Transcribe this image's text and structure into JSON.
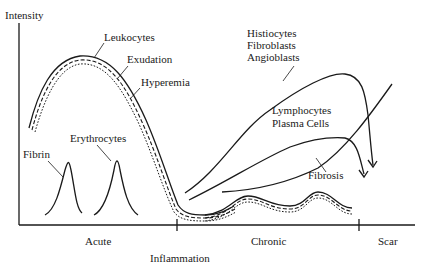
{
  "diagram": {
    "axes": {
      "y_label": "Intensity",
      "x_phase_labels": [
        "Acute",
        "Chronic",
        "Scar"
      ],
      "x_center_label": "Inflammation"
    },
    "curves": {
      "leukocytes": "Leukocytes",
      "exudation": "Exudation",
      "hyperemia": "Hyperemia",
      "fibrin": "Fibrin",
      "erythrocytes": "Erythrocytes",
      "histiocytes_group": [
        "Histiocytes",
        "Fibroblasts",
        "Angioblasts"
      ],
      "lymphocytes_group": [
        "Lymphocytes",
        "Plasma Cells"
      ],
      "fibrosis": "Fibrosis"
    },
    "colors": {
      "ink": "#1a1a1a",
      "background": "#ffffff"
    }
  }
}
